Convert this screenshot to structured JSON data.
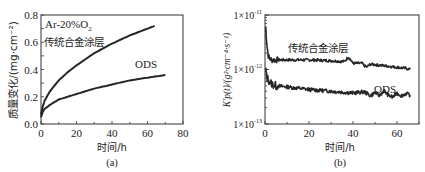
{
  "chart_data": [
    {
      "panel": "a",
      "type": "line",
      "caption": "(a)",
      "title": "",
      "annotation": "Ar-20%O2",
      "xlabel": "时间/h",
      "ylabel": "质量变化/(mg·cm⁻²)",
      "xlim": [
        0,
        80
      ],
      "ylim": [
        0,
        0.8
      ],
      "xticks": [
        0,
        20,
        40,
        60,
        80
      ],
      "yticks": [
        0.0,
        0.2,
        0.4,
        0.6,
        0.8
      ],
      "xtick_labels": [
        "0",
        "20",
        "40",
        "60",
        "80"
      ],
      "ytick_labels": [
        "0.0",
        "0.2",
        "0.4",
        "0.6",
        "0.8"
      ],
      "grid": false,
      "series": [
        {
          "name": "传统合金涂层",
          "x": [
            0,
            1,
            2,
            5,
            10,
            15,
            20,
            30,
            40,
            50,
            60,
            64
          ],
          "y": [
            0.07,
            0.13,
            0.17,
            0.24,
            0.32,
            0.38,
            0.43,
            0.52,
            0.59,
            0.65,
            0.7,
            0.72
          ]
        },
        {
          "name": "ODS",
          "x": [
            0,
            1,
            2,
            5,
            10,
            15,
            20,
            30,
            40,
            50,
            60,
            70
          ],
          "y": [
            0.05,
            0.09,
            0.11,
            0.14,
            0.18,
            0.2,
            0.22,
            0.26,
            0.29,
            0.32,
            0.34,
            0.36
          ]
        }
      ]
    },
    {
      "panel": "b",
      "type": "line",
      "caption": "(b)",
      "title": "",
      "xlabel": "时间/h",
      "ylabel": "K'p(t)/(g²·cm⁻⁴·s⁻¹)",
      "xlim": [
        0,
        70
      ],
      "ylim": [
        1e-13,
        1e-11
      ],
      "yscale": "log",
      "xticks": [
        0,
        20,
        40,
        60
      ],
      "xtick_labels": [
        "0",
        "20",
        "40",
        "60"
      ],
      "ytick_labels": [
        "1×10⁻¹¹",
        "1×10⁻¹²",
        "1×10⁻¹³"
      ],
      "grid": false,
      "series": [
        {
          "name": "传统合金涂层",
          "x": [
            0.3,
            0.6,
            1,
            1.5,
            2,
            3,
            5,
            10,
            20,
            30,
            36,
            38,
            40,
            44,
            46,
            48,
            52,
            56,
            60,
            64,
            66
          ],
          "y": [
            6e-12,
            4e-12,
            2.5e-12,
            1.8e-12,
            1.6e-12,
            1.5e-12,
            1.5e-12,
            1.5e-12,
            1.5e-12,
            1.45e-12,
            1.4e-12,
            1.7e-12,
            1.3e-12,
            1.3e-12,
            1.1e-12,
            1.25e-12,
            1.2e-12,
            1.15e-12,
            1.1e-12,
            1.05e-12,
            1e-12
          ]
        },
        {
          "name": "ODS",
          "x": [
            0.3,
            0.6,
            1,
            2,
            3,
            5,
            10,
            20,
            30,
            40,
            45,
            48,
            50,
            52,
            54,
            56,
            58,
            60,
            62,
            64,
            66
          ],
          "y": [
            1e-12,
            8e-13,
            7e-13,
            6e-13,
            5.5e-13,
            5e-13,
            4.8e-13,
            4.3e-13,
            4e-13,
            3.7e-13,
            3.9e-13,
            3.3e-13,
            3.8e-13,
            3.3e-13,
            4.1e-13,
            3.4e-13,
            3.1e-13,
            3.7e-13,
            3.3e-13,
            3.6e-13,
            3.4e-13
          ]
        }
      ]
    }
  ],
  "labels": {
    "a": {
      "caption": "(a)",
      "xlabel": "时间/h",
      "ylabel": "质量变化/(mg·cm⁻²)",
      "annotation_main": "Ar-20%O",
      "annotation_sub": "2",
      "series1": "传统合金涂层",
      "series2": "ODS",
      "xticks": [
        "0",
        "20",
        "40",
        "60",
        "80"
      ],
      "yticks": [
        "0.0",
        "0.2",
        "0.4",
        "0.6",
        "0.8"
      ]
    },
    "b": {
      "caption": "(b)",
      "xlabel": "时间/h",
      "ylabel": "K'p(t)/(g²·cm⁻⁴·s⁻¹)",
      "series1": "传统合金涂层",
      "series2": "ODS",
      "xticks": [
        "0",
        "20",
        "40",
        "60"
      ],
      "ytick_base": "1×10",
      "ytick_exps": [
        "-11",
        "-12",
        "-13"
      ]
    }
  },
  "colors": {
    "line": "#262626",
    "axis": "#333333",
    "background": "#ffffff"
  }
}
